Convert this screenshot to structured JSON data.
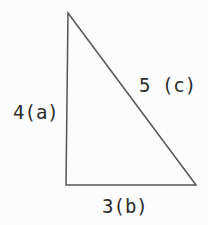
{
  "diagram": {
    "type": "right-triangle",
    "background_color": "#fcfcfc",
    "line_color": "#555555",
    "text_color": "#2d2d2d",
    "sides": {
      "a": {
        "label": "4(a)",
        "name": "a",
        "length": 4,
        "position": "left-vertical-leg"
      },
      "b": {
        "label": "3(b)",
        "name": "b",
        "length": 3,
        "position": "bottom-horizontal-leg"
      },
      "c": {
        "label": "5 (c)",
        "name": "c",
        "length": 5,
        "position": "hypotenuse"
      }
    }
  }
}
